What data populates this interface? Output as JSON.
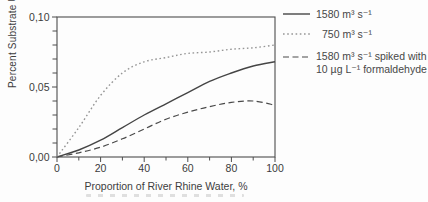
{
  "figure": {
    "background": "#fdfdfd",
    "ink_color": "#4d4d4d",
    "text_color": "#3b3b3b"
  },
  "chart_data": {
    "type": "line",
    "title": "",
    "xlabel": "Proportion of River Rhine Water, %",
    "ylabel": "Percent Substrate Utilization h⁻¹",
    "xlim": [
      0,
      100
    ],
    "ylim": [
      0,
      0.1
    ],
    "grid": false,
    "legend_position": "top-right",
    "x_major_ticks": [
      0,
      20,
      40,
      60,
      80,
      100
    ],
    "x_major_labels": [
      "0",
      "20",
      "40",
      "60",
      "80",
      "100"
    ],
    "x_minor_ticks": [
      10,
      30,
      50,
      70,
      90
    ],
    "y_major_ticks": [
      0,
      0.05,
      0.1
    ],
    "y_major_labels": [
      "0,00",
      "0,05",
      "0,10"
    ],
    "y_minor_ticks": [
      0.01,
      0.02,
      0.03,
      0.04,
      0.06,
      0.07,
      0.08,
      0.09
    ],
    "x": [
      0,
      10,
      20,
      30,
      40,
      50,
      60,
      70,
      80,
      90,
      100
    ],
    "series": [
      {
        "name": "1580 m³ s⁻¹",
        "style": "solid",
        "color": "#454545",
        "values": [
          0.0,
          0.005,
          0.012,
          0.021,
          0.03,
          0.038,
          0.046,
          0.054,
          0.06,
          0.065,
          0.068
        ]
      },
      {
        "name": "750 m³ s⁻¹",
        "style": "dotted",
        "color": "#969696",
        "values": [
          0.0,
          0.021,
          0.044,
          0.06,
          0.068,
          0.071,
          0.074,
          0.075,
          0.077,
          0.078,
          0.08
        ]
      },
      {
        "name": "1580 m³ s⁻¹ spiked with 10 µg L⁻¹ formaldehyde",
        "style": "dashed",
        "color": "#4a4a4a",
        "values": [
          0.0,
          0.003,
          0.007,
          0.013,
          0.02,
          0.027,
          0.032,
          0.036,
          0.039,
          0.04,
          0.037
        ]
      }
    ]
  },
  "legend": {
    "items": [
      {
        "label": "1580 m³ s⁻¹",
        "style": "solid"
      },
      {
        "label": "750 m³ s⁻¹",
        "style": "dotted"
      },
      {
        "label_line1": "1580 m³ s⁻¹ spiked with",
        "label_line2": "10 µg L⁻¹ formaldehyde",
        "style": "dashed"
      }
    ]
  }
}
